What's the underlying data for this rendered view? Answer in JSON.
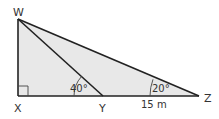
{
  "diagram": {
    "colors": {
      "fill": "#e8e8e8",
      "stroke": "#222222",
      "text": "#333333"
    },
    "vertices": {
      "W": {
        "label": "W",
        "x": 18,
        "y": 19
      },
      "X": {
        "label": "X",
        "x": 18,
        "y": 96
      },
      "Y": {
        "label": "Y",
        "x": 103,
        "y": 96
      },
      "Z": {
        "label": "Z",
        "x": 199,
        "y": 96
      }
    },
    "angles": {
      "WYX": {
        "label": "40°"
      },
      "WZX": {
        "label": "20°"
      },
      "WXZ": {
        "label": "right-angle"
      }
    },
    "segments": {
      "YZ": {
        "label": "15 m"
      }
    }
  }
}
